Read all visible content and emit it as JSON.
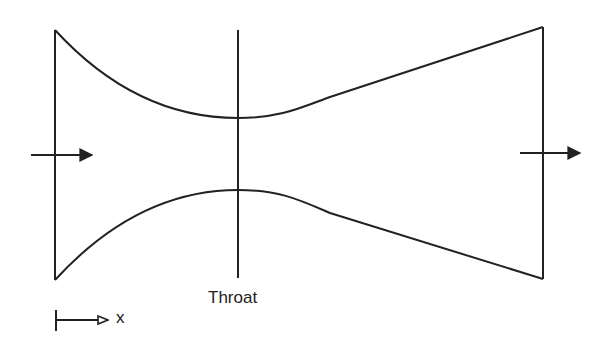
{
  "diagram": {
    "type": "converging-diverging nozzle",
    "throat_label": "Throat",
    "axis_label": "x",
    "stroke_color": "#222222",
    "background": "#ffffff",
    "inlet_flow_arrow": "arrow-right",
    "outlet_flow_arrow": "arrow-right"
  }
}
